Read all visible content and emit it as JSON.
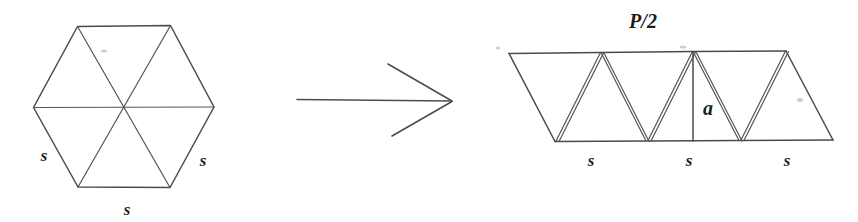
{
  "figure": {
    "background_color": "#ffffff",
    "ink_color": "#4a4a4a",
    "label_color": "#1c1c1c"
  },
  "left_figure": {
    "name": "regular-hexagon",
    "shape": "hexagon",
    "description": "Regular hexagon divided by three long diagonals into six equilateral triangles",
    "vertices": [
      {
        "x": 77,
        "y": 26
      },
      {
        "x": 170,
        "y": 26
      },
      {
        "x": 214,
        "y": 107
      },
      {
        "x": 170,
        "y": 187
      },
      {
        "x": 78,
        "y": 187
      },
      {
        "x": 33,
        "y": 107
      }
    ],
    "center": {
      "x": 124,
      "y": 107
    },
    "labels": [
      {
        "text": "s",
        "x": 44,
        "y": 161,
        "name": "side-label-left"
      },
      {
        "text": "s",
        "x": 203,
        "y": 166,
        "name": "side-label-right"
      },
      {
        "text": "s",
        "x": 127,
        "y": 215,
        "name": "side-label-bottom"
      }
    ]
  },
  "arrow": {
    "name": "transformation-arrow",
    "label": "",
    "tail": {
      "x": 297,
      "y": 99
    },
    "head": {
      "x": 452,
      "y": 101
    },
    "barb_upper": {
      "x": 388,
      "y": 64
    },
    "barb_lower": {
      "x": 392,
      "y": 136
    }
  },
  "right_figure": {
    "name": "triangle-strip",
    "shape": "parallelogram-strip",
    "description": "Six equilateral triangles arranged alternately up and down into a slanted strip, with altitude a marked",
    "top_edge": {
      "x1": 509,
      "y1": 53,
      "x2": 786,
      "y2": 51
    },
    "bottom_edge": {
      "x1": 555,
      "y1": 141,
      "x2": 833,
      "y2": 140
    },
    "top_vertices": [
      {
        "x": 509,
        "y": 53
      },
      {
        "x": 601,
        "y": 52
      },
      {
        "x": 693,
        "y": 51
      },
      {
        "x": 786,
        "y": 51
      }
    ],
    "bottom_vertices": [
      {
        "x": 555,
        "y": 141
      },
      {
        "x": 647,
        "y": 141
      },
      {
        "x": 740,
        "y": 140
      },
      {
        "x": 833,
        "y": 140
      }
    ],
    "altitude": {
      "label": "a",
      "x": 693,
      "y_top": 52,
      "y_bottom": 141,
      "label_x": 700,
      "label_y": 115
    },
    "labels": [
      {
        "text": "P/2",
        "x": 643,
        "y": 28,
        "name": "perimeter-half-label"
      },
      {
        "text": "a",
        "x": 700,
        "y": 115,
        "name": "apothem-label"
      },
      {
        "text": "s",
        "x": 591,
        "y": 166,
        "name": "base-label-1"
      },
      {
        "text": "s",
        "x": 689,
        "y": 166,
        "name": "base-label-2"
      },
      {
        "text": "s",
        "x": 787,
        "y": 166,
        "name": "base-label-3"
      }
    ]
  }
}
